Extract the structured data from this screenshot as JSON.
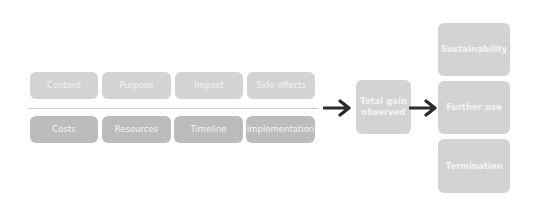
{
  "diagram": {
    "top_row": [
      "Content",
      "Purpose",
      "Impact",
      "Side effects"
    ],
    "bottom_row": [
      "Costs",
      "Resources",
      "Timeline",
      "Implementation"
    ],
    "center": "Total gain observed",
    "outcomes": [
      "Sustainability",
      "Further use",
      "Termination"
    ],
    "colors": {
      "light_box": "#d3d3d3",
      "dark_box": "#bcbcbc",
      "arrow": "#2b2b2b",
      "text": "#f4f4f4"
    }
  }
}
